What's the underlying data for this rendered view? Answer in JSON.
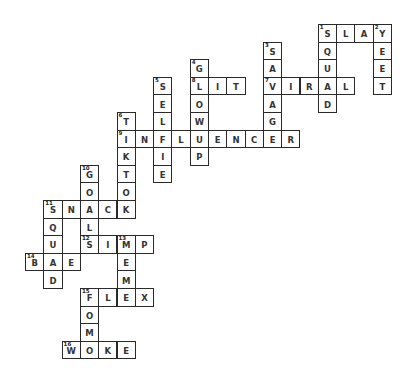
{
  "puzzle": {
    "type": "crossword",
    "grid": {
      "origin_x": 25,
      "origin_y": 24,
      "cell_w": 18.3,
      "cell_h": 17.6
    },
    "words": [
      {
        "number": 1,
        "answer": "SLAY",
        "direction": "across",
        "row": 0,
        "col": 16
      },
      {
        "number": 1,
        "answer": "SQUAD",
        "direction": "down",
        "row": 0,
        "col": 16
      },
      {
        "number": 2,
        "answer": "YEET",
        "direction": "down",
        "row": 0,
        "col": 19
      },
      {
        "number": 3,
        "answer": "SAVAGE",
        "direction": "down",
        "row": 1,
        "col": 13
      },
      {
        "number": 4,
        "answer": "GLOWUP",
        "direction": "down",
        "row": 2,
        "col": 9
      },
      {
        "number": 5,
        "answer": "SELFIE",
        "direction": "down",
        "row": 3,
        "col": 7
      },
      {
        "number": 6,
        "answer": "TIKTOK",
        "direction": "down",
        "row": 5,
        "col": 5
      },
      {
        "number": 7,
        "answer": "VIRAL",
        "direction": "across",
        "row": 3,
        "col": 13
      },
      {
        "number": 8,
        "answer": "LIT",
        "direction": "across",
        "row": 3,
        "col": 9
      },
      {
        "number": 9,
        "answer": "INFLUENCER",
        "direction": "across",
        "row": 6,
        "col": 5
      },
      {
        "number": 10,
        "answer": "GOAL",
        "direction": "down",
        "row": 8,
        "col": 3
      },
      {
        "number": 11,
        "answer": "SNACK",
        "direction": "across",
        "row": 10,
        "col": 1
      },
      {
        "number": 11,
        "answer": "SQUAD",
        "direction": "down",
        "row": 10,
        "col": 1
      },
      {
        "number": 12,
        "answer": "SIMP",
        "direction": "across",
        "row": 12,
        "col": 3
      },
      {
        "number": 13,
        "answer": "MEME",
        "direction": "down",
        "row": 12,
        "col": 5
      },
      {
        "number": 14,
        "answer": "BAE",
        "direction": "across",
        "row": 13,
        "col": 0
      },
      {
        "number": 15,
        "answer": "FLEX",
        "direction": "across",
        "row": 15,
        "col": 3
      },
      {
        "number": 15,
        "answer": "FOMO",
        "direction": "down",
        "row": 15,
        "col": 3
      },
      {
        "number": 16,
        "answer": "WOKE",
        "direction": "across",
        "row": 18,
        "col": 2
      }
    ]
  }
}
